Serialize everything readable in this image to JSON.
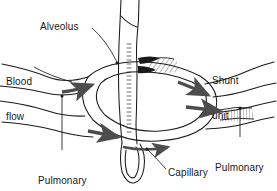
{
  "figure": {
    "background_color": "#ffffff",
    "ink_color": "#1a1a1a",
    "arrow_color": "#4d4d4d"
  },
  "labels": {
    "alveolus": "Alveolus",
    "blood_flow_line1": "Blood",
    "blood_flow_line2": "flow",
    "shunt_unit_line1": "Shunt",
    "shunt_unit_line2": "unit",
    "pulmonary_arteriole_line1": "Pulmonary",
    "pulmonary_arteriole_line2": "arteriole",
    "capillary": "Capillary",
    "pulmonary_venule_line1": "Pulmonary",
    "pulmonary_venule_line2": "venule"
  },
  "structures": [
    {
      "name": "alveolus",
      "description": "vertical alveolar duct with hatched wall ending in rounded alveolar sac"
    },
    {
      "name": "capillary-loop",
      "description": "elliptical capillary network encircling the alveolus"
    },
    {
      "name": "pulmonary-arteriole",
      "description": "vessel entering from the left"
    },
    {
      "name": "pulmonary-venule",
      "description": "vessel exiting to the right"
    },
    {
      "name": "shunt-region",
      "description": "hatched area where blood bypasses the alveolus"
    }
  ],
  "flow_arrows": [
    {
      "name": "inflow-upper-arrow",
      "direction": "right"
    },
    {
      "name": "inflow-lower-arrow",
      "direction": "right"
    },
    {
      "name": "outflow-upper-arrow",
      "direction": "right"
    },
    {
      "name": "outflow-lower-arrow",
      "direction": "right"
    },
    {
      "name": "capillary-bottom-arrow",
      "direction": "right"
    }
  ]
}
